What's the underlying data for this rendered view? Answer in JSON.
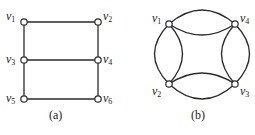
{
  "figure_a": {
    "caption": "(a)",
    "vertices": [
      {
        "id": "v1",
        "base": "v",
        "sub": "1",
        "x": 24,
        "y": 22,
        "lx": 5,
        "ly": 19
      },
      {
        "id": "v2",
        "base": "v",
        "sub": "2",
        "x": 98,
        "y": 22,
        "lx": 103,
        "ly": 19
      },
      {
        "id": "v3",
        "base": "v",
        "sub": "3",
        "x": 24,
        "y": 60,
        "lx": 5,
        "ly": 64
      },
      {
        "id": "v4",
        "base": "v",
        "sub": "4",
        "x": 98,
        "y": 60,
        "lx": 103,
        "ly": 64
      },
      {
        "id": "v5",
        "base": "v",
        "sub": "5",
        "x": 24,
        "y": 99,
        "lx": 5,
        "ly": 103
      },
      {
        "id": "v6",
        "base": "v",
        "sub": "6",
        "x": 98,
        "y": 99,
        "lx": 103,
        "ly": 103
      }
    ],
    "edges": [
      [
        "v1",
        "v2"
      ],
      [
        "v3",
        "v4"
      ],
      [
        "v5",
        "v6"
      ],
      [
        "v1",
        "v3"
      ],
      [
        "v3",
        "v5"
      ],
      [
        "v2",
        "v4"
      ],
      [
        "v4",
        "v6"
      ]
    ]
  },
  "figure_b": {
    "caption": "(b)",
    "vertices": [
      {
        "id": "v1",
        "base": "v",
        "sub": "1",
        "x": 169,
        "y": 24,
        "lx": 151,
        "ly": 22
      },
      {
        "id": "v4",
        "base": "v",
        "sub": "4",
        "x": 235,
        "y": 24,
        "lx": 240,
        "ly": 22
      },
      {
        "id": "v2",
        "base": "v",
        "sub": "2",
        "x": 169,
        "y": 84,
        "lx": 151,
        "ly": 94
      },
      {
        "id": "v3",
        "base": "v",
        "sub": "3",
        "x": 235,
        "y": 84,
        "lx": 240,
        "ly": 94
      }
    ],
    "edges": [
      {
        "from": "v1",
        "to": "v4",
        "type": "outer"
      },
      {
        "from": "v1",
        "to": "v4",
        "type": "inner"
      },
      {
        "from": "v1",
        "to": "v2",
        "type": "outer"
      },
      {
        "from": "v1",
        "to": "v2",
        "type": "inner"
      },
      {
        "from": "v4",
        "to": "v3",
        "type": "outer"
      },
      {
        "from": "v4",
        "to": "v3",
        "type": "inner"
      },
      {
        "from": "v2",
        "to": "v3",
        "type": "outer"
      },
      {
        "from": "v2",
        "to": "v3",
        "type": "inner"
      }
    ]
  }
}
